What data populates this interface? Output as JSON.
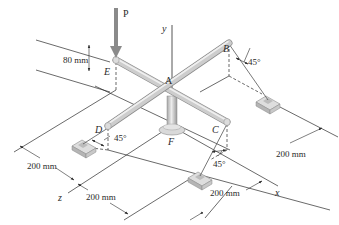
{
  "figure": {
    "type": "3D isometric engineering statics diagram",
    "colors": {
      "line": "#2a2a2a",
      "rod": "#c9c9c9",
      "rod_highlight": "#e9e9e9",
      "rod_shadow": "#a0a0a0",
      "load_arrow": "#8a8a8a",
      "anchor": "#cfcfcf"
    }
  },
  "labels": {
    "load": "P",
    "point_a": "A",
    "point_b": "B",
    "point_c": "C",
    "point_d": "D",
    "point_e": "E",
    "point_f": "F",
    "axis_x": "x",
    "axis_y": "y",
    "axis_z": "z"
  },
  "angles": {
    "at_b": "45°",
    "at_c": "45°",
    "at_d": "45°"
  },
  "dimensions": {
    "height_e": "80 mm",
    "left": "200 mm",
    "bottom_left": "200 mm",
    "bottom_right": "200 mm",
    "right": "200 mm"
  }
}
